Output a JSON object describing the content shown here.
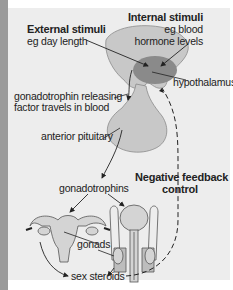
{
  "diagram": {
    "labels": {
      "external_title": "External stimuli",
      "external_example": "eg day length",
      "internal_title": "Internal stimuli",
      "internal_example_1": "eg blood",
      "internal_example_2": "hormone levels",
      "hypothalamus": "hypothalamus",
      "gnrh_1": "gonadotrophin releasing",
      "gnrh_2": "factor travels in blood",
      "anterior_pituitary": "anterior pituitary",
      "gonadotrophins": "gonadotrophins",
      "feedback_1": "Negative feedback",
      "feedback_2": "control",
      "gonads": "gonads",
      "sex_steroids": "sex steroids"
    },
    "colors": {
      "panel": "#ededed",
      "brain": "#c8c8c8",
      "hypothalamus": "#8a8a8a",
      "pituitary": "#c8c8c8",
      "organ_fill": "#d4d4d4",
      "organ_stroke": "#555555",
      "text": "#222222"
    }
  }
}
